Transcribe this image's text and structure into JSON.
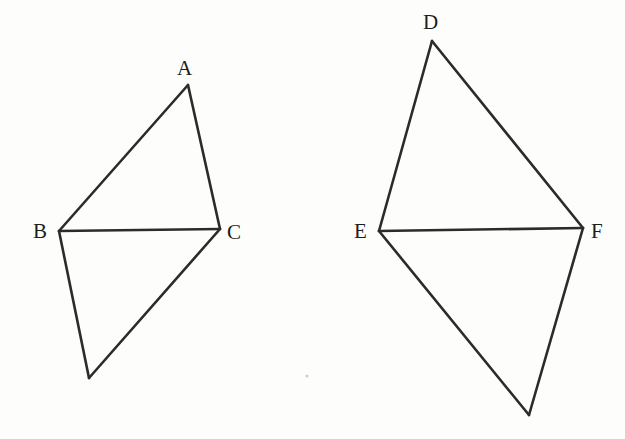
{
  "figure": {
    "background_color": "#fdfdfc",
    "stroke_color": "#2b2b2b",
    "stroke_width": 2.6,
    "label_color": "#1d1d1d",
    "canvas": {
      "width": 625,
      "height": 439
    }
  },
  "shapes": [
    {
      "name": "left-figure",
      "kind": "kite-of-two-triangles",
      "shared_base": "BC",
      "vertices": [
        {
          "id": "A",
          "label": "A",
          "x": 188,
          "y": 85,
          "label_x": 177,
          "label_y": 58
        },
        {
          "id": "B",
          "label": "B",
          "x": 59,
          "y": 231,
          "label_x": 33,
          "label_y": 221
        },
        {
          "id": "C",
          "label": "C",
          "x": 220,
          "y": 229,
          "label_x": 227,
          "label_y": 222
        },
        {
          "id": "Gl",
          "label": "",
          "x": 89,
          "y": 378,
          "label_x": null,
          "label_y": null
        }
      ],
      "edges": [
        {
          "from": "A",
          "to": "B"
        },
        {
          "from": "A",
          "to": "C"
        },
        {
          "from": "B",
          "to": "C"
        },
        {
          "from": "B",
          "to": "Gl"
        },
        {
          "from": "Gl",
          "to": "C"
        }
      ]
    },
    {
      "name": "right-figure",
      "kind": "kite-of-two-triangles",
      "shared_base": "EF",
      "vertices": [
        {
          "id": "D",
          "label": "D",
          "x": 432,
          "y": 41,
          "label_x": 423,
          "label_y": 12
        },
        {
          "id": "E",
          "label": "E",
          "x": 379,
          "y": 231,
          "label_x": 354,
          "label_y": 221
        },
        {
          "id": "F",
          "label": "F",
          "x": 583,
          "y": 228,
          "label_x": 591,
          "label_y": 221
        },
        {
          "id": "Gr",
          "label": "",
          "x": 529,
          "y": 415,
          "label_x": null,
          "label_y": null
        }
      ],
      "edges": [
        {
          "from": "D",
          "to": "E"
        },
        {
          "from": "D",
          "to": "F"
        },
        {
          "from": "E",
          "to": "F"
        },
        {
          "from": "E",
          "to": "Gr"
        },
        {
          "from": "Gr",
          "to": "F"
        }
      ]
    }
  ],
  "artifacts": [
    {
      "name": "scan-speck",
      "x": 307,
      "y": 376,
      "r": 1.6
    }
  ],
  "labels": {
    "A": "A",
    "B": "B",
    "C": "C",
    "D": "D",
    "E": "E",
    "F": "F"
  }
}
